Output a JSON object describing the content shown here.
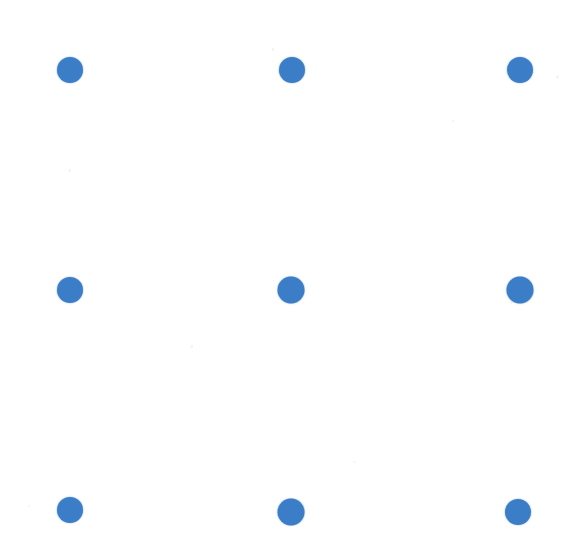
{
  "canvas": {
    "width": 581,
    "height": 550,
    "background_color": "#ffffff",
    "description": "Blue dot grid on white paper"
  },
  "chart_data": {
    "type": "scatter",
    "title": "",
    "subtitle": "",
    "xlabel": "",
    "ylabel": "",
    "grid": false,
    "legend": null,
    "marker": {
      "shape": "circle",
      "color": "#3b7dc6",
      "diameter_px": 26,
      "edge": "soft-antialiased"
    },
    "xlim": [
      0,
      581
    ],
    "ylim": [
      0,
      550
    ],
    "tick_labels_x": [],
    "tick_labels_y": [],
    "grid_shape": {
      "rows": 3,
      "cols": 3
    },
    "column_centers_x": [
      70,
      291,
      520
    ],
    "row_centers_y": [
      70,
      290,
      512
    ],
    "points": [
      {
        "id": "dot-r1-c1",
        "row": 1,
        "col": 1,
        "x": 70,
        "y": 70,
        "d": 26,
        "color": "#3b7dc6"
      },
      {
        "id": "dot-r1-c2",
        "row": 1,
        "col": 2,
        "x": 292,
        "y": 70,
        "d": 26,
        "color": "#3b7dc6"
      },
      {
        "id": "dot-r1-c3",
        "row": 1,
        "col": 3,
        "x": 520,
        "y": 70,
        "d": 26,
        "color": "#3b7dc6"
      },
      {
        "id": "dot-r2-c1",
        "row": 2,
        "col": 1,
        "x": 70,
        "y": 290,
        "d": 26,
        "color": "#3b7dc6"
      },
      {
        "id": "dot-r2-c2",
        "row": 2,
        "col": 2,
        "x": 291,
        "y": 290,
        "d": 27,
        "color": "#3b7dc6"
      },
      {
        "id": "dot-r2-c3",
        "row": 2,
        "col": 3,
        "x": 520,
        "y": 290,
        "d": 27,
        "color": "#3b7dc6"
      },
      {
        "id": "dot-r3-c1",
        "row": 3,
        "col": 1,
        "x": 70,
        "y": 510,
        "d": 26,
        "color": "#3b7dc6"
      },
      {
        "id": "dot-r3-c2",
        "row": 3,
        "col": 2,
        "x": 291,
        "y": 512,
        "d": 27,
        "color": "#3b7dc6"
      },
      {
        "id": "dot-r3-c3",
        "row": 3,
        "col": 3,
        "x": 518,
        "y": 512,
        "d": 26,
        "color": "#3b7dc6"
      }
    ]
  }
}
